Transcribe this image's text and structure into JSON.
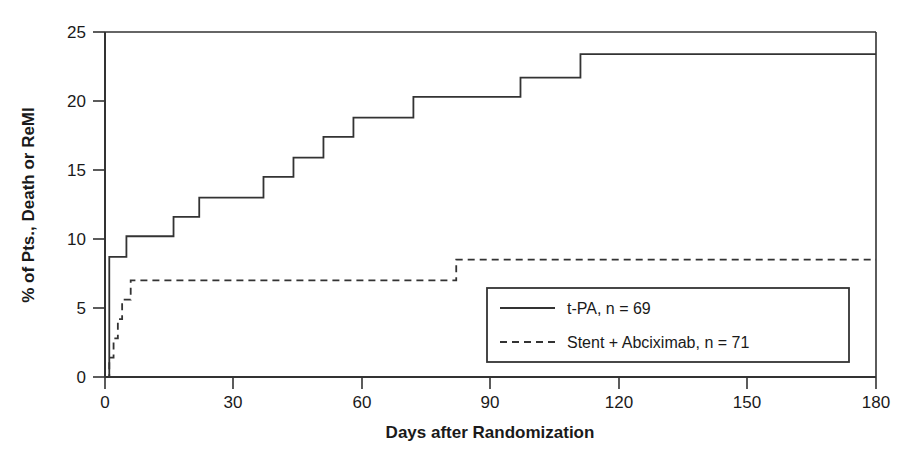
{
  "figure": {
    "background": "#ffffff",
    "ink_color": "#333333"
  },
  "chart_data": {
    "type": "line",
    "subtype": "kaplan-meier-step",
    "title": "",
    "xlabel": "Days after Randomization",
    "ylabel": "% of Pts., Death or ReMI",
    "xlim": [
      0,
      180
    ],
    "ylim": [
      0,
      25
    ],
    "xticks": [
      0,
      30,
      60,
      90,
      120,
      150,
      180
    ],
    "yticks": [
      0,
      5,
      10,
      15,
      20,
      25
    ],
    "xtick_labels": [
      "0",
      "30",
      "60",
      "90",
      "120",
      "150",
      "180"
    ],
    "ytick_labels": [
      "0",
      "5",
      "10",
      "15",
      "20",
      "25"
    ],
    "grid": false,
    "legend_position": "inside-lower-right",
    "series": [
      {
        "name": "t-PA, n = 69",
        "style": "solid",
        "color": "#333333",
        "n": 69,
        "x": [
          0,
          1,
          2,
          5,
          16,
          22,
          37,
          44,
          51,
          58,
          72,
          82,
          97,
          111,
          180
        ],
        "y": [
          0,
          8.7,
          8.7,
          10.2,
          10.2,
          11.6,
          13.0,
          14.5,
          15.9,
          17.4,
          18.8,
          20.3,
          20.3,
          21.7,
          23.4
        ],
        "steps": [
          {
            "day": 0,
            "value": 0.0
          },
          {
            "day": 1,
            "value": 8.7
          },
          {
            "day": 5,
            "value": 10.2
          },
          {
            "day": 16,
            "value": 11.6
          },
          {
            "day": 22,
            "value": 13.0
          },
          {
            "day": 37,
            "value": 14.5
          },
          {
            "day": 44,
            "value": 15.9
          },
          {
            "day": 51,
            "value": 17.4
          },
          {
            "day": 58,
            "value": 18.8
          },
          {
            "day": 72,
            "value": 20.3
          },
          {
            "day": 97,
            "value": 21.7
          },
          {
            "day": 111,
            "value": 23.4
          },
          {
            "day": 180,
            "value": 23.4
          }
        ]
      },
      {
        "name": "Stent + Abciximab, n = 71",
        "style": "dashed",
        "color": "#333333",
        "n": 71,
        "x": [
          0,
          1,
          2,
          3,
          4,
          6,
          82,
          180
        ],
        "y": [
          0,
          1.4,
          2.8,
          4.2,
          5.6,
          7.0,
          8.5,
          8.5
        ],
        "steps": [
          {
            "day": 0,
            "value": 0.0
          },
          {
            "day": 1,
            "value": 1.4
          },
          {
            "day": 2,
            "value": 2.8
          },
          {
            "day": 3,
            "value": 4.2
          },
          {
            "day": 4,
            "value": 5.6
          },
          {
            "day": 6,
            "value": 7.0
          },
          {
            "day": 82,
            "value": 8.5
          },
          {
            "day": 180,
            "value": 8.5
          }
        ]
      }
    ],
    "legend": [
      {
        "label": "t-PA, n = 69",
        "style": "solid"
      },
      {
        "label": "Stent + Abciximab, n = 71",
        "style": "dashed"
      }
    ]
  }
}
